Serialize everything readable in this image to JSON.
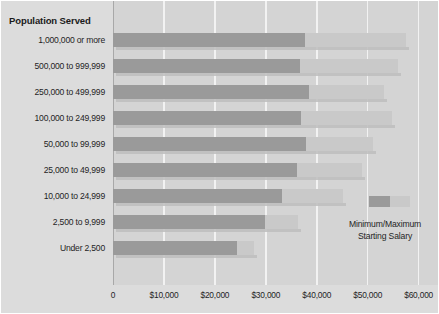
{
  "chart_data": {
    "type": "bar",
    "title": "Population Served",
    "xlabel": "",
    "ylabel": "Population Served",
    "orientation": "horizontal",
    "style": "range-bar",
    "xlim": [
      0,
      64000
    ],
    "grid": true,
    "grid_axis": "x",
    "tick_values": [
      0,
      10000,
      20000,
      30000,
      40000,
      50000,
      60000
    ],
    "tick_labels": [
      "0",
      "$10,000",
      "$20,000",
      "$30,000",
      "$40,000",
      "$50,000",
      "$60,000"
    ],
    "categories": [
      "1,000,000 or more",
      "500,000 to 999,999",
      "250,000 to 499,999",
      "100,000 to 249,999",
      "50,000 to 99,999",
      "25,000 to 49,999",
      "10,000 to 24,999",
      "2,500 to 9,999",
      "Under 2,500"
    ],
    "series": [
      {
        "name": "Minimum Starting Salary",
        "color": "#9a9a9a",
        "values": [
          37600,
          36700,
          38400,
          37000,
          37800,
          36100,
          33100,
          29800,
          24300
        ]
      },
      {
        "name": "Maximum Starting Salary",
        "color": "#c9c9c9",
        "values": [
          57600,
          55900,
          53300,
          54700,
          51000,
          48800,
          45100,
          36300,
          27600
        ]
      }
    ],
    "annotations": [
      {
        "text": "Minimum/Maximum",
        "id": "legend-line-1"
      },
      {
        "text": "Starting Salary",
        "id": "legend-line-2"
      }
    ],
    "legend": {
      "position": "inside-bottom-right",
      "label_line_1": "Minimum/Maximum",
      "label_line_2": "Starting Salary"
    },
    "colors": {
      "minimum_bar": "#9a9a9a",
      "maximum_bar": "#c9c9c9",
      "plot_background": "#d4d4d4",
      "label_panel_background": "#dcdcdc",
      "gridline": "#f2f2f2",
      "axis": "#8f8f8f",
      "text": "#1f1f1f"
    }
  }
}
